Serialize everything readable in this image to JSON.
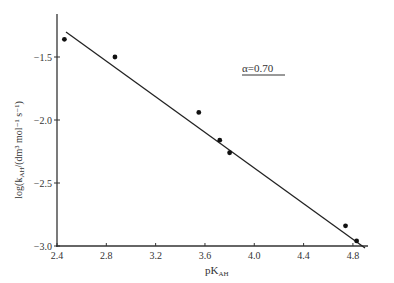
{
  "chart_data": {
    "type": "scatter",
    "title": "",
    "xlabel": "pK_AH",
    "ylabel": "log(k_AH/(dm³ mol⁻¹ s⁻¹))",
    "xlim": [
      2.4,
      5.0
    ],
    "ylim": [
      -3.0,
      -1.2
    ],
    "x_ticks": [
      2.4,
      2.8,
      3.2,
      3.6,
      4.0,
      4.4,
      4.8
    ],
    "x_tick_labels": [
      "2.4",
      "2.8",
      "3.2",
      "3.6",
      "4.0",
      "4.4",
      "4.8"
    ],
    "y_ticks": [
      -1.5,
      -2.0,
      -2.5,
      -3.0
    ],
    "y_tick_labels": [
      "−1.5",
      "−2.0",
      "−2.5",
      "−3.0"
    ],
    "grid": false,
    "annotation": "α=0.70",
    "series": [
      {
        "name": "data",
        "x": [
          2.46,
          2.87,
          3.55,
          3.72,
          3.8,
          4.74,
          4.83
        ],
        "y": [
          -1.36,
          -1.5,
          -1.94,
          -2.16,
          -2.26,
          -2.84,
          -2.96
        ]
      }
    ],
    "fit_line": {
      "slope": -0.7,
      "x": [
        2.47,
        4.9
      ],
      "y": [
        -1.28,
        -3.0
      ]
    }
  },
  "labels": {
    "x_axis": "pK",
    "x_axis_sub": "AH",
    "y_axis_prefix": "log(k",
    "y_axis_sub": "AH",
    "y_axis_suffix": "/(dm³ mol⁻¹ s⁻¹)",
    "annotation": "α=0.70"
  }
}
